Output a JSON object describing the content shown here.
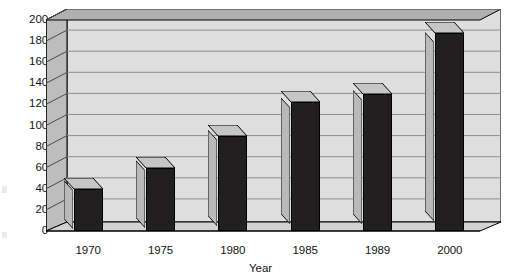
{
  "chart_data": {
    "type": "bar",
    "title": "",
    "subtitle": "",
    "xlabel": "Year",
    "ylabel": "",
    "categories": [
      "1970",
      "1975",
      "1980",
      "1985",
      "1989",
      "2000"
    ],
    "values": [
      40,
      60,
      90,
      122,
      130,
      188
    ],
    "ylim": [
      0,
      200
    ],
    "ytick_labels": [
      "200",
      "180",
      "160",
      "140",
      "120",
      "100",
      "80",
      "60",
      "40",
      "20",
      "0"
    ],
    "ytick_values": [
      200,
      180,
      160,
      140,
      120,
      100,
      80,
      60,
      40,
      20,
      0
    ],
    "ytick_step": 20,
    "grid": true,
    "grid_axis": "y",
    "legend": false,
    "legend_position": "none",
    "style": "3d-column",
    "series": [
      {
        "name": "",
        "values": [
          40,
          60,
          90,
          122,
          130,
          188
        ]
      }
    ]
  },
  "colors": {
    "bar_front": "#211f20",
    "bar_side": "#b9b9b9",
    "bar_top": "#c6c6c6",
    "plot_floor": "#e2e2e2",
    "plot_wall": "#dedede",
    "plot_wall_side": "#bdbdbd",
    "plot_wall_top": "#b0b0b0",
    "gridline": "#8d8d8d",
    "axis_line": "#000000",
    "text": "#151515",
    "background": "#ffffff"
  }
}
